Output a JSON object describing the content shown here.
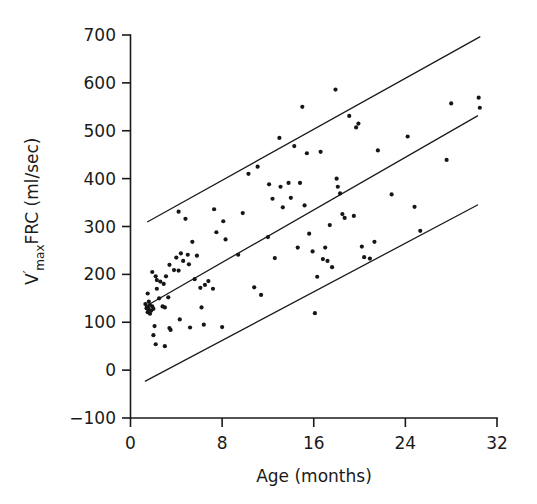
{
  "chart_data": {
    "type": "scatter",
    "title": "",
    "xlabel": "Age (months)",
    "ylabel": "V'max FRC (ml/sec)",
    "ylabel_parts": {
      "lead": "V",
      "prime": "′",
      "subscript": "max",
      "trail": "FRC (ml/sec)"
    },
    "xlim": [
      0,
      32
    ],
    "ylim": [
      -100,
      700
    ],
    "xticks": [
      0,
      8,
      16,
      24,
      32
    ],
    "xtick_labels": [
      "0",
      "8",
      "16",
      "24",
      "32"
    ],
    "yticks": [
      -100,
      0,
      100,
      200,
      300,
      400,
      500,
      600,
      700
    ],
    "ytick_labels": [
      "−100",
      "0",
      "100",
      "200",
      "300",
      "400",
      "500",
      "600",
      "700"
    ],
    "grid": false,
    "legend": null,
    "marker": "dot",
    "marker_color": "#161616",
    "line_color": "#1a1a1a",
    "series": [
      {
        "name": "V'max FRC measurements",
        "points": [
          [
            1.5,
            131
          ],
          [
            1.6,
            127
          ],
          [
            1.7,
            136
          ],
          [
            1.8,
            124
          ],
          [
            1.5,
            121
          ],
          [
            1.9,
            133
          ],
          [
            1.6,
            143
          ],
          [
            1.4,
            129
          ],
          [
            2.0,
            128
          ],
          [
            1.7,
            118
          ],
          [
            1.5,
            160
          ],
          [
            2.3,
            170
          ],
          [
            2.2,
            196
          ],
          [
            1.9,
            205
          ],
          [
            2.6,
            185
          ],
          [
            2.9,
            180
          ],
          [
            2.3,
            188
          ],
          [
            3.1,
            196
          ],
          [
            2.5,
            150
          ],
          [
            3.3,
            152
          ],
          [
            3.0,
            131
          ],
          [
            3.4,
            220
          ],
          [
            3.8,
            209
          ],
          [
            4.0,
            235
          ],
          [
            4.4,
            244
          ],
          [
            4.6,
            228
          ],
          [
            4.2,
            208
          ],
          [
            5.0,
            241
          ],
          [
            5.4,
            268
          ],
          [
            5.1,
            221
          ],
          [
            5.8,
            239
          ],
          [
            4.8,
            316
          ],
          [
            4.2,
            331
          ],
          [
            5.6,
            190
          ],
          [
            6.1,
            172
          ],
          [
            6.5,
            178
          ],
          [
            6.8,
            186
          ],
          [
            6.2,
            131
          ],
          [
            7.2,
            170
          ],
          [
            7.5,
            288
          ],
          [
            7.3,
            336
          ],
          [
            8.1,
            311
          ],
          [
            8.3,
            273
          ],
          [
            9.4,
            241
          ],
          [
            9.8,
            328
          ],
          [
            10.3,
            410
          ],
          [
            10.8,
            173
          ],
          [
            11.4,
            157
          ],
          [
            11.1,
            425
          ],
          [
            12.1,
            388
          ],
          [
            12.4,
            358
          ],
          [
            12.0,
            278
          ],
          [
            12.6,
            234
          ],
          [
            13.0,
            485
          ],
          [
            13.3,
            340
          ],
          [
            13.1,
            383
          ],
          [
            13.8,
            391
          ],
          [
            14.0,
            360
          ],
          [
            14.3,
            468
          ],
          [
            14.6,
            256
          ],
          [
            14.8,
            391
          ],
          [
            15.2,
            344
          ],
          [
            15.0,
            550
          ],
          [
            15.4,
            453
          ],
          [
            15.6,
            285
          ],
          [
            15.9,
            248
          ],
          [
            16.1,
            119
          ],
          [
            16.3,
            195
          ],
          [
            16.6,
            456
          ],
          [
            16.8,
            232
          ],
          [
            17.0,
            256
          ],
          [
            17.2,
            228
          ],
          [
            17.4,
            303
          ],
          [
            17.6,
            215
          ],
          [
            17.9,
            586
          ],
          [
            18.0,
            400
          ],
          [
            18.1,
            383
          ],
          [
            18.3,
            369
          ],
          [
            18.5,
            326
          ],
          [
            18.7,
            318
          ],
          [
            19.1,
            531
          ],
          [
            19.5,
            322
          ],
          [
            19.7,
            507
          ],
          [
            19.9,
            515
          ],
          [
            20.2,
            258
          ],
          [
            20.4,
            236
          ],
          [
            20.9,
            233
          ],
          [
            21.3,
            268
          ],
          [
            21.6,
            459
          ],
          [
            22.8,
            367
          ],
          [
            24.2,
            488
          ],
          [
            24.8,
            341
          ],
          [
            25.3,
            291
          ],
          [
            27.6,
            439
          ],
          [
            28.0,
            557
          ],
          [
            30.4,
            569
          ],
          [
            30.5,
            548
          ],
          [
            2.1,
            92
          ],
          [
            2.0,
            73
          ],
          [
            2.2,
            54
          ],
          [
            3.0,
            50
          ],
          [
            3.4,
            88
          ],
          [
            3.5,
            84
          ],
          [
            4.3,
            106
          ],
          [
            5.2,
            89
          ],
          [
            6.4,
            95
          ],
          [
            8.0,
            90
          ],
          [
            2.8,
            133
          ],
          [
            1.3,
            138
          ]
        ]
      }
    ],
    "trend_lines": [
      {
        "name": "upper-limit-line",
        "x1": 1.5,
        "y1": 310,
        "x2": 30.5,
        "y2": 696
      },
      {
        "name": "regression-line",
        "x1": 1.3,
        "y1": 133,
        "x2": 30.3,
        "y2": 531
      },
      {
        "name": "lower-limit-line",
        "x1": 1.3,
        "y1": -23,
        "x2": 30.3,
        "y2": 345
      }
    ]
  }
}
